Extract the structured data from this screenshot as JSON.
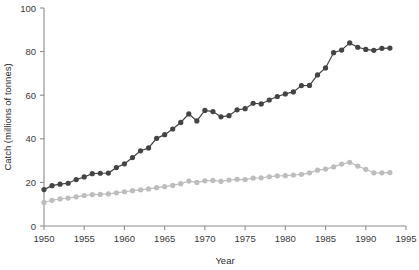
{
  "chart_data": {
    "type": "line",
    "title": "",
    "xlabel": "Year",
    "ylabel": "Catch (millions of tonnes)",
    "xlim": [
      1950,
      1995
    ],
    "ylim": [
      0,
      100
    ],
    "xticks": [
      1950,
      1955,
      1960,
      1965,
      1970,
      1975,
      1980,
      1985,
      1990,
      1995
    ],
    "yticks": [
      0,
      20,
      40,
      60,
      80,
      100
    ],
    "grid": false,
    "legend": "none",
    "x": [
      1950,
      1951,
      1952,
      1953,
      1954,
      1955,
      1956,
      1957,
      1958,
      1959,
      1960,
      1961,
      1962,
      1963,
      1964,
      1965,
      1966,
      1967,
      1968,
      1969,
      1970,
      1971,
      1972,
      1973,
      1974,
      1975,
      1976,
      1977,
      1978,
      1979,
      1980,
      1981,
      1982,
      1983,
      1984,
      1985,
      1986,
      1987,
      1988,
      1989,
      1990,
      1991,
      1992,
      1993
    ],
    "series": [
      {
        "name": "marine-catch",
        "color": "#444444",
        "marker": "circle",
        "values": [
          16.7,
          18.5,
          19.2,
          19.6,
          21.3,
          22.5,
          24.0,
          24.2,
          24.3,
          26.8,
          28.5,
          31.4,
          34.5,
          35.8,
          40.2,
          41.9,
          44.5,
          47.5,
          51.4,
          48.2,
          53.0,
          52.5,
          50.1,
          50.6,
          53.3,
          53.8,
          56.3,
          56.0,
          57.8,
          59.4,
          60.6,
          61.5,
          64.4,
          64.5,
          69.3,
          72.5,
          79.5,
          80.7,
          84.0,
          82.0,
          81.0,
          80.6,
          81.5,
          81.6
        ]
      },
      {
        "name": "secondary-catch",
        "color": "#bdbdbd",
        "marker": "circle",
        "values": [
          10.8,
          11.8,
          12.4,
          12.8,
          13.4,
          14.0,
          14.4,
          14.5,
          14.7,
          15.2,
          15.7,
          16.2,
          16.6,
          17.0,
          17.6,
          18.1,
          18.6,
          19.4,
          20.6,
          20.0,
          20.7,
          20.9,
          20.5,
          21.1,
          21.4,
          21.3,
          22.0,
          22.1,
          22.6,
          23.0,
          23.1,
          23.4,
          23.7,
          24.4,
          25.6,
          26.1,
          27.1,
          28.4,
          29.2,
          27.5,
          26.0,
          24.4,
          24.4,
          24.5
        ]
      }
    ]
  }
}
